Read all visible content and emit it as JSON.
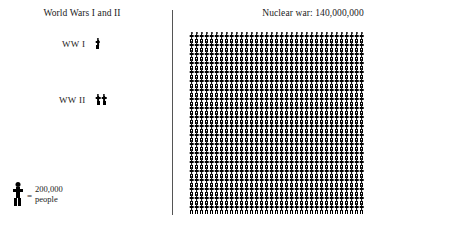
{
  "figure": {
    "background_color": "#ffffff",
    "ink_color": "#000000",
    "divider_color": "#555555"
  },
  "left_panel": {
    "title": "World Wars I and II",
    "rows": [
      {
        "label": "WW I",
        "figures": 1
      },
      {
        "label": "WW II",
        "figures": 2
      }
    ],
    "legend": {
      "icon": "person-icon",
      "equals": "=",
      "value": "200,000",
      "unit": "people"
    }
  },
  "right_panel": {
    "title": "Nuclear war: 140,000,000",
    "grid": {
      "rows": 20,
      "per_row": 35,
      "total_figures": 700
    }
  },
  "chart_data": {
    "type": "bar",
    "xlabel": "",
    "ylabel": "Deaths (people)",
    "unit_per_icon": 200000,
    "unit_label": "200,000 people",
    "categories": [
      "WW I",
      "WW II",
      "Nuclear war"
    ],
    "values": [
      200000,
      400000,
      140000000
    ],
    "icon_counts": [
      1,
      2,
      700
    ],
    "value_labels": [
      "",
      "",
      "140,000,000"
    ],
    "legend": [
      "1 figure = 200,000 people"
    ],
    "grid": false
  }
}
